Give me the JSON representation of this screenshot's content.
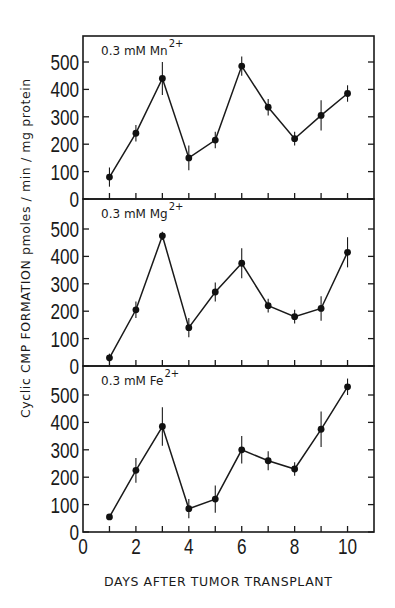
{
  "chart_data": {
    "type": "line",
    "title": "",
    "xlabel": "DAYS AFTER TUMOR TRANSPLANT",
    "ylabel": "Cyclic CMP FORMATION pmoles / min / mg protein",
    "x": [
      1,
      2,
      3,
      4,
      5,
      6,
      7,
      8,
      9,
      10
    ],
    "xlim": [
      0,
      11
    ],
    "xticks": [
      0,
      2,
      4,
      6,
      8,
      10
    ],
    "xticks_minor": [
      1,
      3,
      5,
      7,
      9
    ],
    "ylim": [
      0,
      590
    ],
    "yticks": [
      0,
      100,
      200,
      300,
      400,
      500
    ],
    "grid": false,
    "legend": null,
    "series": [
      {
        "name": "0.3 mM Mn2+",
        "label_main": "0.3 mM  Mn",
        "label_sup": "2+",
        "values": [
          80,
          240,
          440,
          150,
          215,
          485,
          335,
          220,
          305,
          385
        ],
        "errors": [
          35,
          30,
          60,
          45,
          30,
          35,
          30,
          25,
          55,
          30
        ]
      },
      {
        "name": "0.3 mM Mg2+",
        "label_main": "0.3 mM  Mg",
        "label_sup": "2+",
        "values": [
          30,
          205,
          475,
          140,
          270,
          375,
          220,
          180,
          210,
          415
        ],
        "errors": [
          15,
          30,
          15,
          35,
          35,
          55,
          25,
          25,
          45,
          55
        ]
      },
      {
        "name": "0.3 mM Fe2+",
        "label_main": "0.3 mM  Fe",
        "label_sup": "2+",
        "values": [
          55,
          225,
          385,
          85,
          120,
          300,
          260,
          230,
          375,
          530
        ],
        "errors": [
          10,
          45,
          70,
          35,
          50,
          50,
          35,
          25,
          65,
          30
        ]
      }
    ]
  },
  "axis": {
    "xlabel": "DAYS AFTER TUMOR TRANSPLANT",
    "ylabel": "Cyclic  CMP  FORMATION  pmoles / min / mg  protein"
  },
  "layout": {
    "frame_left": 83,
    "frame_right": 374,
    "panels": [
      {
        "top": 36,
        "bottom": 199
      },
      {
        "top": 199,
        "bottom": 366
      },
      {
        "top": 366,
        "bottom": 532
      }
    ],
    "px_per_100": 27.4
  }
}
